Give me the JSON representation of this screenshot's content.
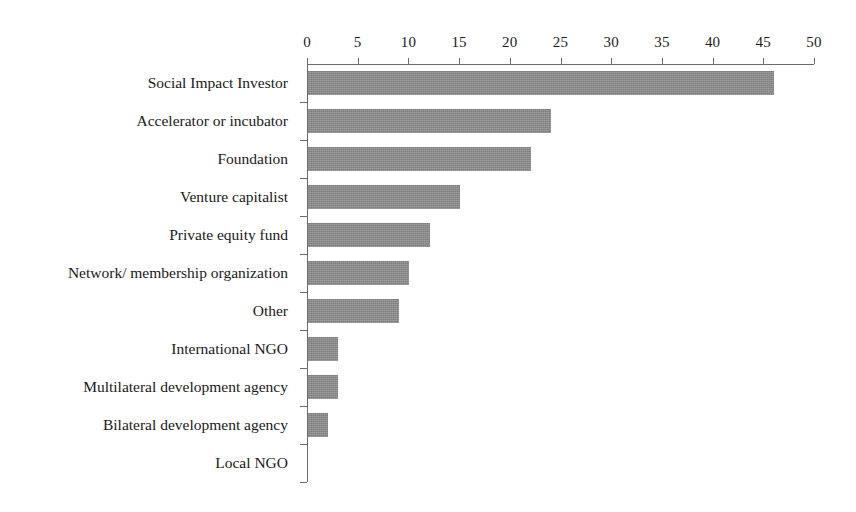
{
  "chart_data": {
    "type": "bar",
    "orientation": "horizontal",
    "title": "",
    "subtitle": "",
    "xlabel": "",
    "ylabel": "",
    "xlim": [
      0,
      50
    ],
    "xtick_step": 5,
    "xticks": [
      "0",
      "5",
      "10",
      "15",
      "20",
      "25",
      "30",
      "35",
      "40",
      "45",
      "50"
    ],
    "grid": false,
    "legend": false,
    "legend_position": "none",
    "axis_position": "top",
    "bar_color": "#7d7d7d",
    "axis_color": "#6b6b6b",
    "text_color": "#1c1c1c",
    "categories": [
      "Social Impact Investor",
      "Accelerator or incubator",
      "Foundation",
      "Venture capitalist",
      "Private equity fund",
      "Network/ membership organization",
      "Other",
      "International NGO",
      "Multilateral development agency",
      "Bilateral development agency",
      "Local NGO"
    ],
    "values": [
      46,
      24,
      22,
      15,
      12,
      10,
      9,
      3,
      3,
      2,
      0
    ]
  }
}
